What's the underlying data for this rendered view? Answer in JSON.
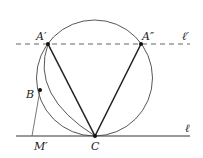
{
  "diagram": {
    "labels": {
      "A1": "A′",
      "A2": "A″",
      "B": "B",
      "C": "C",
      "M": "M′",
      "l": "ℓ",
      "l_prime": "ℓ′"
    },
    "points": {
      "A1": [
        48,
        44
      ],
      "A2": [
        141,
        44
      ],
      "B": [
        40,
        90
      ],
      "C": [
        95,
        136
      ],
      "M": [
        32,
        136
      ]
    },
    "circle": {
      "cx": 94.5,
      "cy": 78,
      "r": 58
    },
    "lines": {
      "l": {
        "y": 136,
        "x1": 16,
        "x2": 190,
        "style": "solid"
      },
      "l_prime": {
        "y": 44,
        "x1": 16,
        "x2": 190,
        "style": "dashed"
      }
    },
    "colors": {
      "stroke": "#333333",
      "thin": "#555555",
      "line_l": "#777777"
    }
  }
}
